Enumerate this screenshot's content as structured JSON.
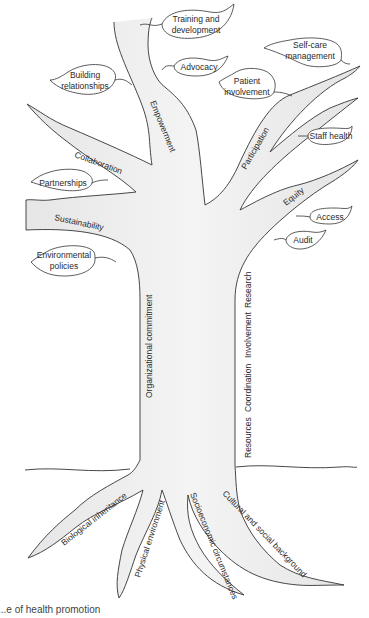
{
  "diagram": {
    "type": "tree-metaphor",
    "caption": "...e of health promotion",
    "colors": {
      "fill": "#ececec",
      "stroke": "#333333",
      "leaf_fill": "#ffffff",
      "text": "#2a2a2a"
    },
    "branches": {
      "empowerment": "Empowerment",
      "participation": "Participation",
      "equity": "Equity",
      "collaboration": "Collaboration",
      "sustainability": "Sustainability"
    },
    "leaves": {
      "training": [
        "Training and",
        "development"
      ],
      "advocacy": [
        "Advocacy"
      ],
      "building": [
        "Building",
        "relationships"
      ],
      "selfcare": [
        "Self-care",
        "management"
      ],
      "patient": [
        "Patient",
        "involvement"
      ],
      "staff": [
        "Staff health"
      ],
      "partnerships": [
        "Partnerships"
      ],
      "access": [
        "Access"
      ],
      "audit": [
        "Audit"
      ],
      "environmental": [
        "Environmental",
        "policies"
      ]
    },
    "trunk": {
      "left": "Organizational commitment",
      "right": [
        "Resources",
        "Coordination",
        "Involvement",
        "Research"
      ]
    },
    "roots": {
      "biological": "Biological inheritance",
      "physical": "Physical environment",
      "socioeconomic": "Socioeconomic circumstances",
      "cultural": "Cultural and social background"
    }
  }
}
